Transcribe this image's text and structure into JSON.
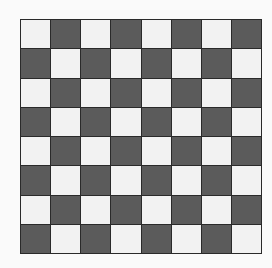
{
  "board": {
    "rows": 8,
    "cols": 8,
    "top_left": "light",
    "colors": {
      "light": "#f2f2f2",
      "dark": "#5b5b5b",
      "grid": "#2a2a2a",
      "background": "#fafafa"
    }
  }
}
